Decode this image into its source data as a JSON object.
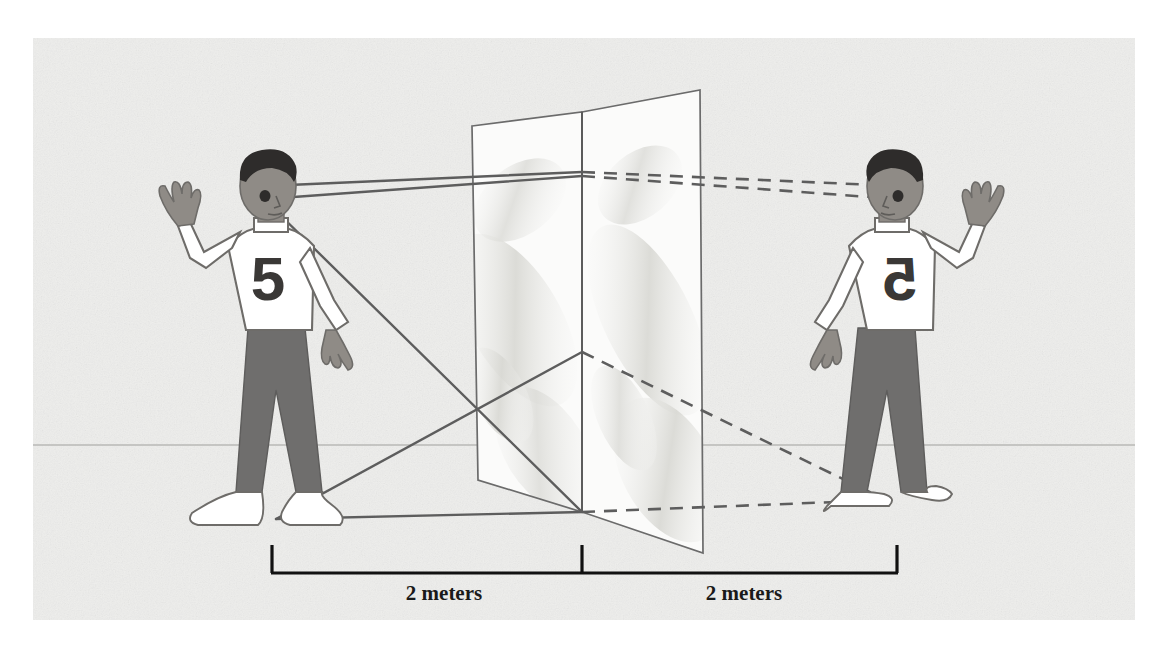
{
  "figure": {
    "background_color": "#ffffff",
    "paper_color": "#eeeeec",
    "ink_color": "#595959",
    "label_color": "#1a1a1a"
  },
  "canvas": {
    "width": 1173,
    "height": 657,
    "paper": {
      "x": 33,
      "y": 38,
      "width": 1102,
      "height": 582
    }
  },
  "horizon": {
    "label": "ground-horizon-line",
    "y": 445,
    "x_start": 33,
    "x_end": 1135,
    "color": "#b9b9b6"
  },
  "mirror": {
    "label": "plane-mirror",
    "panel_fill": "#fbfbfa",
    "edge_color": "#6b6b6b",
    "smudge_color": "#e2e2de",
    "left_panel": {
      "name": "mirror-left-panel",
      "points": "472,126 582,112 582,512 478,480"
    },
    "right_panel": {
      "name": "mirror-right-panel",
      "points": "582,112 700,90 703,553 582,512"
    },
    "center_seam": {
      "x1": 582,
      "y1": 112,
      "x2": 582,
      "y2": 512
    }
  },
  "people": [
    {
      "id": "real-boy",
      "name": "real-person-left",
      "role": "real object",
      "shirt_number": "5",
      "number_mirrored": false,
      "raised_hand": "right",
      "eye": {
        "x": 266,
        "y": 196
      },
      "foot": {
        "x": 276,
        "y": 519
      },
      "colors": {
        "hair": "#2e2c2b",
        "skin": "#8f8b86",
        "shirt": "#ffffff",
        "shirt_outline": "#6e6c69",
        "trousers": "#6f6e6d",
        "shoes": "#ffffff",
        "number": "#3a3836"
      }
    },
    {
      "id": "mirror-image-boy",
      "name": "mirror-image-right",
      "role": "virtual image",
      "shirt_number": "5",
      "number_mirrored": true,
      "raised_hand": "left",
      "eye": {
        "x": 897,
        "y": 196
      },
      "foot": {
        "x": 886,
        "y": 500
      },
      "colors": {
        "hair": "#2e2c2b",
        "skin": "#8f8b86",
        "shirt": "#ffffff",
        "shirt_outline": "#6e6c69",
        "trousers": "#6f6e6d",
        "shoes": "#ffffff",
        "number": "#3a3836"
      }
    }
  ],
  "rays": {
    "solid": {
      "name": "incident-reflected-rays",
      "style": "solid",
      "color": "#5d5d5d",
      "width": 2.4,
      "segments": [
        {
          "name": "ray-eye-to-mirror-top",
          "x1": 266,
          "y1": 186,
          "x2": 582,
          "y2": 172
        },
        {
          "name": "ray-eye-to-mirror-upper",
          "x1": 266,
          "y1": 199,
          "x2": 582,
          "y2": 176
        },
        {
          "name": "ray-eye-to-mirror-bottom",
          "x1": 268,
          "y1": 203,
          "x2": 582,
          "y2": 512
        },
        {
          "name": "ray-foot-to-mirror-center",
          "x1": 276,
          "y1": 519,
          "x2": 582,
          "y2": 512
        },
        {
          "name": "ray-mirror-center-to-lower-left",
          "x1": 582,
          "y1": 352,
          "x2": 276,
          "y2": 519
        },
        {
          "name": "ray-mirror-upper-to-center",
          "x1": 582,
          "y1": 172,
          "x2": 582,
          "y2": 512
        }
      ]
    },
    "dashed": {
      "name": "virtual-image-rays",
      "style": "dashed",
      "color": "#5d5d5d",
      "width": 2.6,
      "dash_pattern": "13,9",
      "segments": [
        {
          "name": "dashed-mirror-top-to-image-eye",
          "x1": 582,
          "y1": 172,
          "x2": 897,
          "y2": 186
        },
        {
          "name": "dashed-mirror-top-to-image-eye-2",
          "x1": 582,
          "y1": 176,
          "x2": 897,
          "y2": 199
        },
        {
          "name": "dashed-center-to-image-foot",
          "x1": 582,
          "y1": 352,
          "x2": 886,
          "y2": 500
        },
        {
          "name": "dashed-mirror-base-to-image-foot",
          "x1": 582,
          "y1": 512,
          "x2": 886,
          "y2": 500
        }
      ]
    }
  },
  "measurements": {
    "name": "distance-scale",
    "bracket_color": "#111111",
    "baseline_y": 573,
    "tick_top_y": 545,
    "left_tick_x": 272,
    "center_tick_x": 582,
    "right_tick_x": 897,
    "items": [
      {
        "name": "measure-left",
        "label": "2 meters",
        "label_x": 444,
        "label_y": 594
      },
      {
        "name": "measure-right",
        "label": "2 meters",
        "label_x": 744,
        "label_y": 594
      }
    ]
  }
}
